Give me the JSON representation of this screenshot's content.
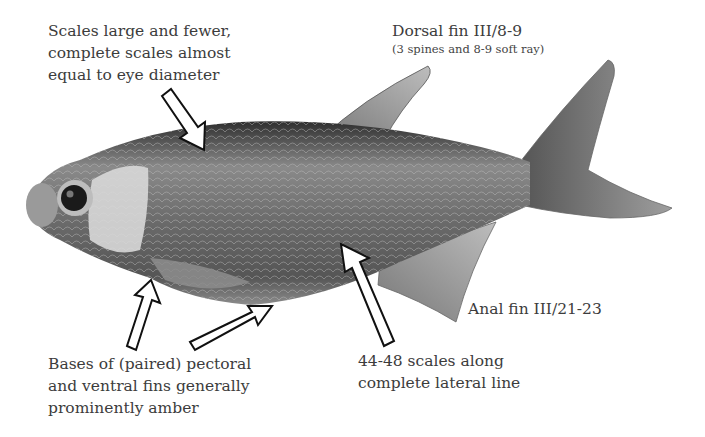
{
  "figure": {
    "image_style": "grayscale photograph of fish, side view, facing left"
  },
  "annotations": {
    "scales": {
      "lines": [
        "Scales large and fewer,",
        "complete scales almost",
        "equal to eye diameter"
      ]
    },
    "dorsal_fin": {
      "title": "Dorsal fin III/8-9",
      "subtitle": "(3 spines and 8-9 soft ray)"
    },
    "anal_fin": {
      "title": "Anal fin III/21-23"
    },
    "lateral_line": {
      "lines": [
        "44-48 scales along",
        "complete lateral line"
      ]
    },
    "fin_bases": {
      "lines": [
        "Bases of (paired) pectoral",
        "and ventral fins generally",
        "prominently amber"
      ]
    }
  },
  "colors": {
    "background": "#ffffff",
    "text": "#3c3c3c",
    "arrow_fill": "#ffffff",
    "arrow_stroke": "#111111",
    "fish_dark": "#2b2b2b",
    "fish_mid": "#7a7a7a",
    "fish_light": "#c9c9c9"
  }
}
